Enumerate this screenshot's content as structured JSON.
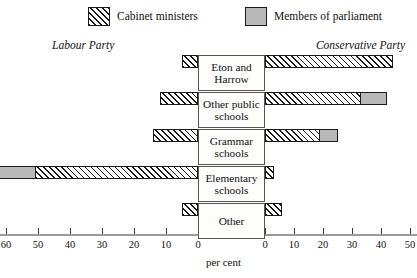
{
  "legend": {
    "items": [
      {
        "label": "Cabinet ministers",
        "swatch": "hatched-swatch",
        "color": "#ffffff"
      },
      {
        "label": "Members of parliament",
        "swatch": "solid-gray-swatch",
        "color": "#b8b8b8"
      }
    ]
  },
  "party_labels": {
    "left": "Labour Party",
    "right": "Conservative Party"
  },
  "axis": {
    "title": "per cent",
    "left_ticks": [
      "70",
      "60",
      "50",
      "40",
      "30",
      "20",
      "10",
      "0"
    ],
    "right_ticks": [
      "0",
      "10",
      "20",
      "30",
      "40",
      "50"
    ]
  },
  "categories": [
    "Eton and Harrow",
    "Other public schools",
    "Grammar schools",
    "Elementary schools",
    "Other"
  ],
  "chart_data": {
    "type": "bar",
    "subtype": "bidirectional-population-pyramid",
    "xlabel": "per cent",
    "ylabel": "",
    "categories": [
      "Eton and Harrow",
      "Other public schools",
      "Grammar schools",
      "Elementary schools",
      "Other"
    ],
    "sides": [
      {
        "name": "Labour Party",
        "direction": "left",
        "axis_range": [
          0,
          70
        ]
      },
      {
        "name": "Conservative Party",
        "direction": "right",
        "axis_range": [
          0,
          50
        ]
      }
    ],
    "series": [
      {
        "name": "Members of parliament",
        "style": "solid-gray",
        "color": "#b8b8b8",
        "labour": [
          2,
          8,
          14,
          68,
          0
        ],
        "conservative": [
          34,
          42,
          25,
          1,
          0
        ]
      },
      {
        "name": "Cabinet ministers",
        "style": "hatched",
        "color": "#ffffff",
        "labour": [
          5,
          12,
          14,
          51,
          5
        ],
        "conservative": [
          44,
          33,
          19,
          3,
          6
        ]
      }
    ],
    "grid": false,
    "legend_position": "top"
  }
}
